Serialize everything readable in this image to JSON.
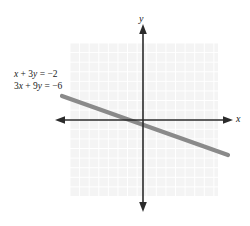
{
  "figure": {
    "background_color": "#ffffff",
    "width": 250,
    "height": 226
  },
  "axes": {
    "x_label": "x",
    "y_label": "y",
    "axis_color": "#2b2b2b",
    "origin_px": [
      143,
      120
    ]
  },
  "grid": {
    "visible": true,
    "fill_color": "#f4f4f4",
    "line_color": "#ffffff",
    "cell_px": 9.6,
    "bounds_px": {
      "left": 70,
      "top": 43,
      "right": 218,
      "bottom": 196
    }
  },
  "annotations": {
    "equation_1": "x + 3y = −2",
    "equation_2": "3x + 9y = −6",
    "equation_1_parts": {
      "lhs_var1": "x",
      "op": "+",
      "coef2": "3",
      "var2": "y",
      "eq": "=",
      "rhs": "−2"
    },
    "equation_2_parts": {
      "coef1": "3",
      "lhs_var1": "x",
      "op": "+",
      "coef2": "9",
      "var2": "y",
      "eq": "=",
      "rhs": "−6"
    }
  },
  "chart_data": {
    "type": "line",
    "title": "",
    "xlabel": "x",
    "ylabel": "y",
    "grid": true,
    "legend": "none",
    "xlim": [
      -7.7,
      7.8
    ],
    "ylim": [
      -8,
      8
    ],
    "annotations": [
      "x + 3y = −2",
      "3x + 9y = −6"
    ],
    "series": [
      {
        "name": "x + 3y = -2 (coincident with 3x + 9y = -6)",
        "color": "#8a8a8a",
        "linewidth_px": 4,
        "slope": -0.3333333333,
        "intercept": -0.6666666667,
        "x_intercept": -2,
        "y_intercept": -0.6666666667,
        "x": [
          -8.4,
          8.9
        ],
        "y": [
          2.13,
          -3.63
        ],
        "endpoints_px": [
          [
            62,
            96
          ],
          [
            228,
            155
          ]
        ]
      }
    ]
  }
}
